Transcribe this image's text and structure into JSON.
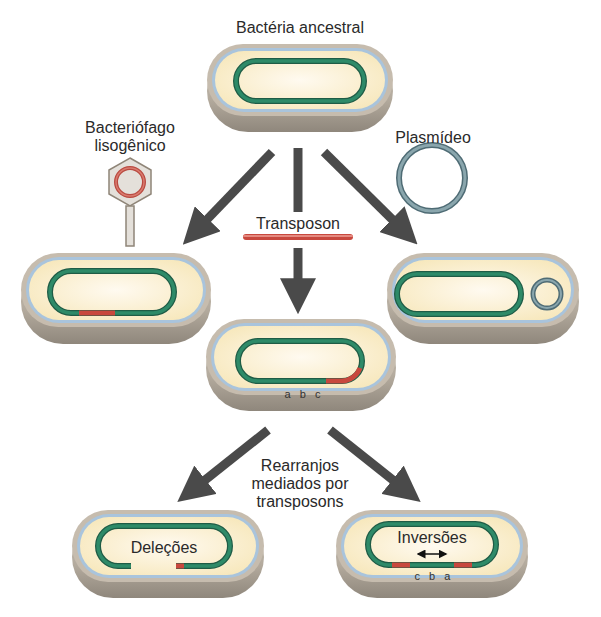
{
  "title": "Bactéria ancestral",
  "labels": {
    "bacteriophage_line1": "Bacteriófago",
    "bacteriophage_line2": "lisogênico",
    "plasmid": "Plasmídeo",
    "transposon": "Transposon",
    "rearrangement_line1": "Rearranjos",
    "rearrangement_line2": "mediados por",
    "rearrangement_line3": "transposons",
    "deletions": "Deleções",
    "inversions": "Inversões",
    "gene_order_center": "a b c",
    "gene_order_inverted": "c b a"
  },
  "colors": {
    "chromosome": "#2e8a68",
    "chromosome_dark": "#1f5c46",
    "transposon": "#d0554a",
    "plasmid": "#6b8b93",
    "cytoplasm": "#fbf2d4",
    "membrane": "#a9c4dc",
    "wall": "#b7ada0",
    "arrow": "#4a4a4a"
  },
  "nodes": [
    {
      "id": "ancestral",
      "label": "Bactéria ancestral"
    },
    {
      "id": "lysogen",
      "label": "Bacteriófago lisogênico inserted"
    },
    {
      "id": "transposon_insert",
      "label": "Transposon inserted (a b c)"
    },
    {
      "id": "plasmid_carrier",
      "label": "Plasmídeo acquired"
    },
    {
      "id": "deletion",
      "label": "Deleções"
    },
    {
      "id": "inversion",
      "label": "Inversões (c b a)"
    }
  ]
}
